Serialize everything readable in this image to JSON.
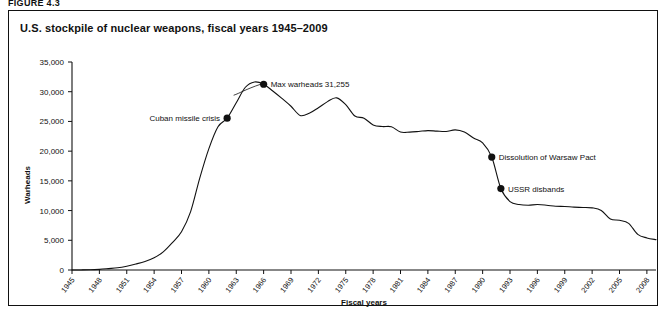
{
  "figure": {
    "label": "FIGURE 4.3",
    "title": "U.S. stockpile of nuclear weapons, fiscal years 1945–2009"
  },
  "chart_data": {
    "type": "line",
    "title": "U.S. stockpile of nuclear weapons, fiscal years 1945–2009",
    "xlabel": "Fiscal years",
    "ylabel": "Warheads",
    "xlim": [
      1945,
      2009
    ],
    "ylim": [
      0,
      35000
    ],
    "grid": false,
    "legend": "none",
    "ytick_labels": [
      "0",
      "5,000",
      "10,000",
      "15,000",
      "20,000",
      "25,000",
      "30,000",
      "35,000"
    ],
    "ytick_values": [
      0,
      5000,
      10000,
      15000,
      20000,
      25000,
      30000,
      35000
    ],
    "xtick_labels": [
      "1945",
      "1948",
      "1951",
      "1954",
      "1957",
      "1960",
      "1963",
      "1966",
      "1969",
      "1972",
      "1975",
      "1978",
      "1981",
      "1984",
      "1987",
      "1990",
      "1993",
      "1996",
      "1999",
      "2002",
      "2005",
      "2008"
    ],
    "xtick_values": [
      1945,
      1948,
      1951,
      1954,
      1957,
      1960,
      1963,
      1966,
      1969,
      1972,
      1975,
      1978,
      1981,
      1984,
      1987,
      1990,
      1993,
      1996,
      1999,
      2002,
      2005,
      2008
    ],
    "series": [
      {
        "name": "U.S. nuclear warhead stockpile",
        "x": [
          1945,
          1946,
          1947,
          1948,
          1949,
          1950,
          1951,
          1952,
          1953,
          1954,
          1955,
          1956,
          1957,
          1958,
          1959,
          1960,
          1961,
          1962,
          1963,
          1964,
          1965,
          1966,
          1967,
          1968,
          1969,
          1970,
          1971,
          1972,
          1973,
          1974,
          1975,
          1976,
          1977,
          1978,
          1979,
          1980,
          1981,
          1982,
          1983,
          1984,
          1985,
          1986,
          1987,
          1988,
          1989,
          1990,
          1991,
          1992,
          1993,
          1994,
          1995,
          1996,
          1997,
          1998,
          1999,
          2000,
          2001,
          2002,
          2003,
          2004,
          2005,
          2006,
          2007,
          2008,
          2009
        ],
        "y": [
          6,
          11,
          32,
          110,
          235,
          369,
          640,
          1005,
          1436,
          2063,
          3057,
          4618,
          6444,
          9822,
          15468,
          20434,
          24111,
          25540,
          28133,
          30751,
          31642,
          31255,
          30130,
          28884,
          27552,
          26008,
          26365,
          27296,
          28335,
          28970,
          27826,
          25914,
          25542,
          24418,
          24138,
          24104,
          23208,
          23205,
          23317,
          23459,
          23368,
          23317,
          23575,
          23205,
          22217,
          21392,
          19008,
          13708,
          11511,
          11012,
          10904,
          11011,
          10903,
          10732,
          10685,
          10577,
          10526,
          10457,
          10027,
          8570,
          8360,
          7853,
          6000,
          5400,
          5113
        ],
        "color": "#111111"
      }
    ],
    "annotations": [
      {
        "label": "Cuban missile crisis",
        "x": 1962,
        "y": 25540,
        "text_side": "left"
      },
      {
        "label": "Max warheads 31,255",
        "x": 1966,
        "y": 31255,
        "text_side": "right"
      },
      {
        "label": "Dissolution of Warsaw Pact",
        "x": 1991,
        "y": 19008,
        "text_side": "right"
      },
      {
        "label": "USSR disbands",
        "x": 1992,
        "y": 13708,
        "text_side": "right"
      }
    ]
  }
}
